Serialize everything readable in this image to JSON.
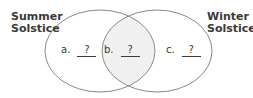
{
  "diagram": {
    "type": "venn",
    "sets": [
      {
        "label_line1": "Summer",
        "label_line2": "Solstice"
      },
      {
        "label_line1": "Winter",
        "label_line2": "Solstice"
      }
    ],
    "regions": [
      {
        "letter": "a.",
        "value": "?"
      },
      {
        "letter": "b.",
        "value": "?"
      },
      {
        "letter": "c.",
        "value": "?"
      }
    ],
    "colors": {
      "outline": "#8a8a8a",
      "intersection_fill": "#f0f0f0",
      "text": "#3a3a3a",
      "background": "#ffffff"
    }
  }
}
